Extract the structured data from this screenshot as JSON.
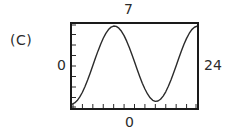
{
  "panel": {
    "label": "(C)"
  },
  "labels": {
    "y_max": "7",
    "y_min": "0",
    "x_max": "24",
    "x_min": "0"
  },
  "colors": {
    "frame": "#1a1a1a",
    "curve": "#2b2b2b",
    "background": "#ffffff",
    "text": "#2b2b2b"
  },
  "chart_data": {
    "type": "line",
    "title": "",
    "xlabel": "",
    "ylabel": "",
    "xlim": [
      0,
      24
    ],
    "ylim": [
      0,
      7
    ],
    "grid": false,
    "legend": null,
    "x_tick_labels": [
      "0",
      "24"
    ],
    "y_tick_labels": [
      "0",
      "7"
    ],
    "x_tick_count": 13,
    "y_tick_count": 9,
    "series": [
      {
        "name": "curve",
        "x": [
          0,
          0.5,
          1,
          1.5,
          2,
          2.5,
          3,
          3.5,
          4,
          4.5,
          5,
          5.5,
          6,
          6.5,
          7,
          7.5,
          8,
          8.5,
          9,
          9.5,
          10,
          10.5,
          11,
          11.5,
          12,
          12.5,
          13,
          13.5,
          14,
          14.5,
          15,
          15.5,
          16,
          16.5,
          17,
          17.5,
          18,
          18.5,
          19,
          19.5,
          20,
          20.5,
          21,
          21.5,
          22,
          22.5,
          23,
          23.5,
          24
        ],
        "y": [
          0.32,
          0.42,
          0.62,
          0.92,
          1.31,
          1.79,
          2.33,
          2.92,
          3.54,
          4.16,
          4.76,
          5.32,
          5.81,
          6.22,
          6.54,
          6.74,
          6.83,
          6.8,
          6.65,
          6.39,
          6.03,
          5.57,
          5.04,
          4.46,
          3.85,
          3.23,
          2.63,
          2.07,
          1.58,
          1.17,
          0.85,
          0.64,
          0.55,
          0.58,
          0.73,
          0.99,
          1.35,
          1.81,
          2.34,
          2.92,
          3.53,
          4.15,
          4.75,
          5.31,
          5.8,
          6.21,
          6.53,
          6.73,
          6.82
        ]
      }
    ]
  }
}
